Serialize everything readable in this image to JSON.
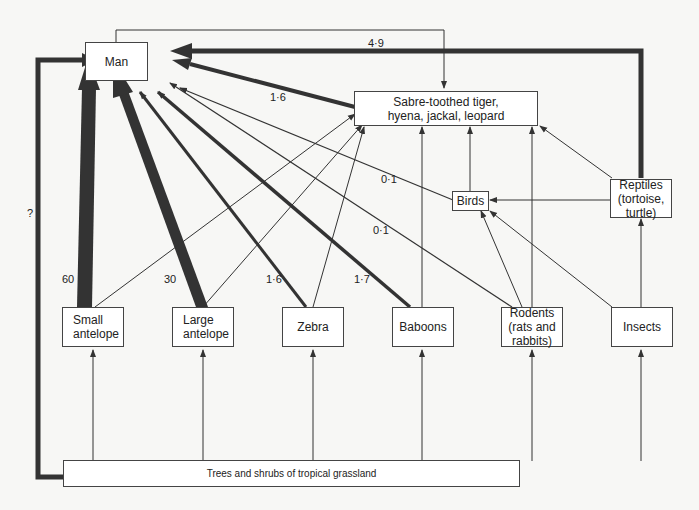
{
  "nodes": {
    "man": "Man",
    "predators": "Sabre-toothed tiger,\nhyena, jackal, leopard",
    "birds": "Birds",
    "reptiles": "Reptiles\n(tortoise,\nturtle)",
    "small_antelope": "Small\nantelope",
    "large_antelope": "Large\nantelope",
    "zebra": "Zebra",
    "baboons": "Baboons",
    "rodents": "Rodents\n(rats and\nrabbits)",
    "insects": "Insects",
    "trees": "Trees and shrubs of tropical grassland"
  },
  "labels": {
    "reptiles_to_man": "4·9",
    "predators_to_man": "1·6",
    "birds_to_man": "0·1",
    "rodents_to_man": "0·1",
    "baboons_to_man": "1·7",
    "zebra_to_man": "1·6",
    "large_antelope_to_man": "30",
    "small_antelope_to_man": "60",
    "trees_to_man": "?"
  }
}
